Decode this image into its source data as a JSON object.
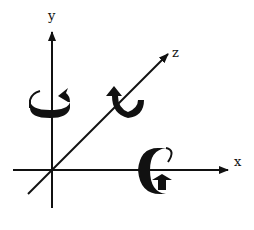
{
  "diagram": {
    "title": "",
    "axes": [
      {
        "name": "x",
        "label": "x"
      },
      {
        "name": "y",
        "label": "y"
      },
      {
        "name": "z",
        "label": "z"
      }
    ],
    "rotation_arrows": [
      {
        "axis": "y",
        "description": "rotation about y axis"
      },
      {
        "axis": "z",
        "description": "rotation about z axis"
      },
      {
        "axis": "x",
        "description": "rotation about x axis"
      }
    ],
    "colors": {
      "ink": "#111111",
      "background": "#ffffff"
    }
  }
}
